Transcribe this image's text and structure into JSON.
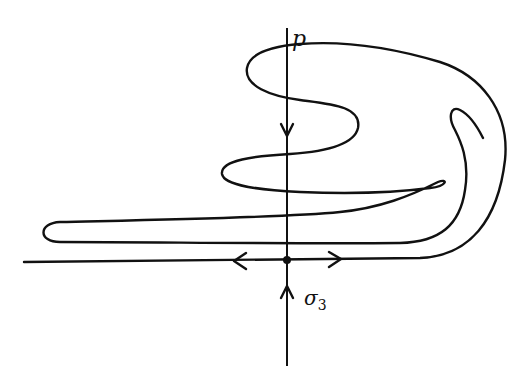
{
  "figure": {
    "type": "phase-portrait-diagram",
    "labels": {
      "unstable_manifold": "p",
      "fixed_point": "σ",
      "fixed_point_subscript": "3"
    },
    "colors": {
      "stroke": "#111111",
      "background": "#ffffff"
    },
    "elements": [
      {
        "name": "vertical-axis",
        "description": "vertical line through fixed point, labeled p"
      },
      {
        "name": "horizontal-axis",
        "description": "horizontal line through fixed point"
      },
      {
        "name": "fixed-point",
        "description": "dot at intersection"
      },
      {
        "name": "manifold-curve",
        "description": "folded curve oscillating around the vertical axis"
      }
    ],
    "arrows": [
      {
        "position": "vertical-upper",
        "direction": "down"
      },
      {
        "position": "vertical-lower",
        "direction": "up"
      },
      {
        "position": "horizontal-left",
        "direction": "left"
      },
      {
        "position": "horizontal-right",
        "direction": "right"
      }
    ]
  }
}
